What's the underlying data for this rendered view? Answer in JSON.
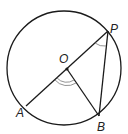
{
  "diagram": {
    "type": "circle-theorem",
    "labels": {
      "center": "O",
      "point_p": "P",
      "point_a": "A",
      "point_b": "B"
    },
    "colors": {
      "stroke": "#1a1a1a",
      "angle_mark": "#888888"
    },
    "elements": [
      "circle with center O",
      "diameter AP through O",
      "radius OB",
      "chord PB",
      "double arc angle mark at O (angle AOB)",
      "single arc angle mark at P (angle OPB)"
    ]
  }
}
